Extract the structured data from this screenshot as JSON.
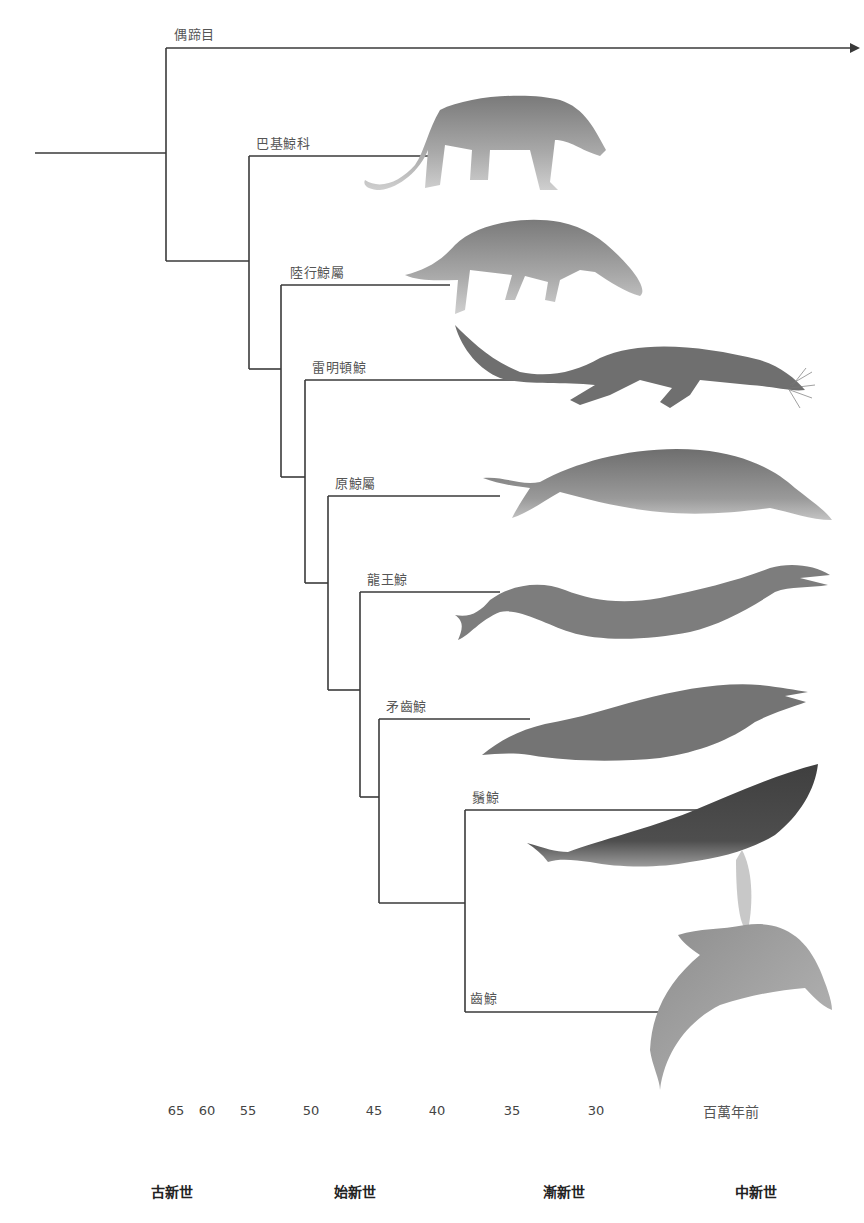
{
  "diagram": {
    "type": "cladogram",
    "outgroup": {
      "label": "偶蹄目"
    },
    "taxa": [
      {
        "id": "pakicetidae",
        "label": "巴基鯨科"
      },
      {
        "id": "ambulocetus",
        "label": "陸行鯨屬"
      },
      {
        "id": "rodhocetus",
        "label": "雷明頓鯨"
      },
      {
        "id": "protocetus",
        "label": "原鯨屬"
      },
      {
        "id": "basilosaurus",
        "label": "龍王鯨"
      },
      {
        "id": "dorudon",
        "label": "矛齒鯨"
      },
      {
        "id": "mysticeti",
        "label": "鬚鯨"
      },
      {
        "id": "odontoceti",
        "label": "齒鯨"
      }
    ]
  },
  "time_axis": {
    "ticks": [
      "65",
      "60",
      "55",
      "50",
      "45",
      "40",
      "35",
      "30"
    ],
    "unit": "百萬年前"
  },
  "epochs": [
    "古新世",
    "始新世",
    "漸新世",
    "中新世"
  ],
  "colors": {
    "line": "#3a3a3a",
    "label": "#555555",
    "animal_light": "#b5b5b5",
    "animal_mid": "#8a8a8a",
    "animal_dark": "#555555"
  }
}
